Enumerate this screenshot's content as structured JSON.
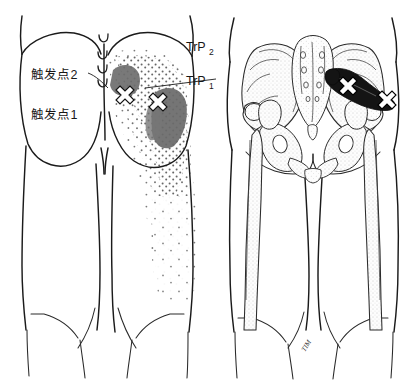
{
  "figure": {
    "background_color": "#ffffff",
    "ink_color": "#1b1b1b"
  },
  "labels": {
    "trigger_point_2_cjk": "触发点2",
    "trigger_point_1_cjk": "触发点1",
    "trp2": "TrP",
    "trp2_sub": "2",
    "trp1": "TrP",
    "trp1_sub": "1",
    "signature": "TIM"
  },
  "left_panel": {
    "name": "referred-pain-diagram",
    "description": "Posterior view of buttocks and thighs with stippled referred pain pattern",
    "essential_zone_color": "#6e6e6e",
    "spillover_stipple_color": "#6b6b6b",
    "trigger_points": [
      {
        "id": "TrP2",
        "label": "触发点2",
        "x": 120,
        "y": 96
      },
      {
        "id": "TrP1",
        "label": "触发点1",
        "x": 153,
        "y": 103
      }
    ],
    "sacral_marks": 4
  },
  "right_panel": {
    "name": "skeletal-anatomy-diagram",
    "description": "Posterior view of pelvis, sacrum and femurs with piriformis muscle shaded black",
    "muscle_name": "piriformis",
    "muscle_color": "#141414",
    "bone_fill": "#fdfdfd",
    "trigger_points": [
      {
        "id": "TrP2",
        "x": 343,
        "y": 86
      },
      {
        "id": "TrP1",
        "x": 382,
        "y": 100
      }
    ]
  }
}
